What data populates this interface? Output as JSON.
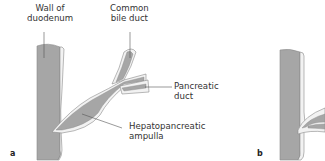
{
  "figure": {
    "panels": [
      {
        "id": "a",
        "letter": "a",
        "labels": {
          "wall_of_duodenum": [
            "Wall of",
            "duodenum"
          ],
          "common_bile_duct": [
            "Common",
            "bile duct"
          ],
          "pancreatic_duct": [
            "Pancreatic",
            "duct"
          ],
          "hepatopancreatic_ampulla": [
            "Hepatopancreatic",
            "ampulla"
          ]
        }
      },
      {
        "id": "b",
        "letter": "b"
      }
    ],
    "colors": {
      "tissue_fill": "#a6a6a6",
      "wall_fill": "#f2f2f2",
      "outline": "#8a8a8a",
      "leader_line": "#555555",
      "text": "#333333"
    }
  }
}
